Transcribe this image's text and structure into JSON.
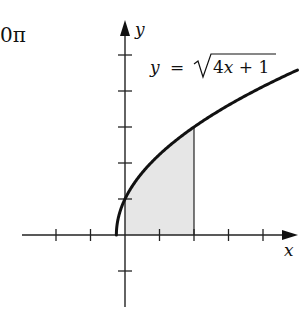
{
  "corner_text": "0π",
  "equation": {
    "lhs": "y",
    "eq": "=",
    "radicand": "4x + 1",
    "label_full": "y = √(4x + 1)"
  },
  "axes": {
    "x_label": "x",
    "y_label": "y"
  },
  "colors": {
    "curve": "#111111",
    "shade": "#e6e6e6",
    "axis": "#222222"
  },
  "chart_data": {
    "type": "area",
    "title": "",
    "function": "y = sqrt(4x + 1)",
    "xlabel": "x",
    "ylabel": "y",
    "xlim": [
      -3,
      5
    ],
    "ylim": [
      -1,
      5
    ],
    "x_ticks": [
      -2,
      -1,
      1,
      2,
      3,
      4
    ],
    "y_ticks": [
      -1,
      1,
      2,
      3,
      4,
      5
    ],
    "tick_labels_shown": false,
    "grid": false,
    "curve_domain": [
      -0.25,
      5
    ],
    "shaded_region": {
      "x_from": 0,
      "x_to": 2,
      "under": "y = sqrt(4x + 1)",
      "above": "x-axis"
    },
    "points": [
      {
        "x": -0.25,
        "y": 0
      },
      {
        "x": 0,
        "y": 1
      },
      {
        "x": 0.5,
        "y": 1.732
      },
      {
        "x": 1,
        "y": 2.236
      },
      {
        "x": 2,
        "y": 3
      },
      {
        "x": 3,
        "y": 3.606
      },
      {
        "x": 4,
        "y": 4.123
      },
      {
        "x": 5,
        "y": 4.583
      }
    ]
  }
}
